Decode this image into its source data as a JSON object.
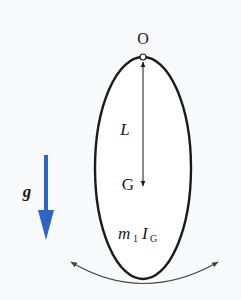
{
  "diagram": {
    "title": "",
    "labels": {
      "pivot": "O",
      "length": "L",
      "center_of_mass": "G",
      "mass": "m",
      "mass_sub": "1",
      "inertia": "I",
      "inertia_sub": "G",
      "gravity": "g"
    },
    "colors": {
      "background": "#f7f9fb",
      "outline": "#1a1a1a",
      "gravity_arrow": "#2f63c6",
      "swing_arrow": "#444444"
    },
    "elements": [
      {
        "id": "rigid-body",
        "shape": "ellipse"
      },
      {
        "id": "pivot",
        "shape": "small-circle",
        "label": "O"
      },
      {
        "id": "length-arrow",
        "shape": "double-arrow",
        "from": "O",
        "to": "G",
        "label": "L"
      },
      {
        "id": "gravity-arrow",
        "shape": "arrow",
        "direction": "down",
        "label": "g"
      },
      {
        "id": "swing-arrow",
        "shape": "curved-double-arrow"
      }
    ]
  }
}
